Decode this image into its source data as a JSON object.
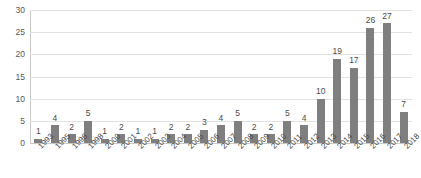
{
  "chart_data": {
    "type": "bar",
    "title": "",
    "subtitle": "",
    "xlabel": "",
    "ylabel": "",
    "ylim": [
      0,
      30
    ],
    "yticks": [
      0,
      5,
      10,
      15,
      20,
      25,
      30
    ],
    "grid": true,
    "legend": false,
    "legend_position": "none",
    "bar_color": "#7f7f7f",
    "gridline_color": "#e2e2e2",
    "categories": [
      "1993",
      "1995",
      "1996",
      "1998",
      "2000",
      "2001",
      "2002",
      "2003",
      "2004",
      "2005",
      "2006",
      "2007",
      "2008",
      "2009",
      "2010",
      "2011",
      "2012",
      "2013",
      "2014",
      "2015",
      "2016",
      "2017",
      "2018"
    ],
    "values": [
      1,
      4,
      2,
      5,
      1,
      2,
      1,
      1,
      2,
      2,
      3,
      4,
      5,
      2,
      2,
      5,
      4,
      10,
      19,
      17,
      26,
      27,
      7
    ],
    "data_labels": [
      "1",
      "4",
      "2",
      "5",
      "1",
      "2",
      "1",
      "1",
      "2",
      "2",
      "3",
      "4",
      "5",
      "2",
      "2",
      "5",
      "4",
      "10",
      "19",
      "17",
      "26",
      "27",
      "7"
    ]
  }
}
